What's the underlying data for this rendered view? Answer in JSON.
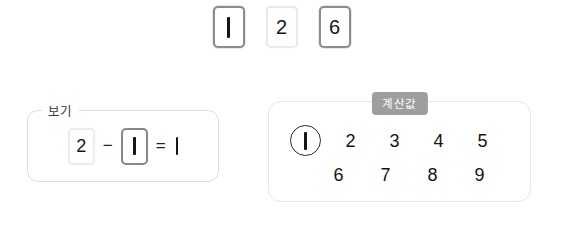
{
  "canvas": {
    "background": "#ffffff",
    "width": 563,
    "height": 233
  },
  "top_cards": {
    "name": "number-card-tray",
    "items": [
      {
        "value": "1",
        "state": "selected",
        "render": "stroke"
      },
      {
        "value": "2",
        "state": "unselected",
        "render": "glyph"
      },
      {
        "value": "6",
        "state": "selected",
        "render": "glyph"
      }
    ]
  },
  "example_box": {
    "legend": "보기",
    "equation": {
      "operand_a": "2",
      "operand_a_state": "unselected",
      "operator": "−",
      "operand_b": "1",
      "operand_b_state": "selected",
      "equals": "=",
      "result": "1"
    }
  },
  "calc_panel": {
    "badge": "계산값",
    "rows": [
      {
        "numbers": [
          {
            "value": "1",
            "circled": true,
            "render": "stroke"
          },
          {
            "value": "2",
            "circled": false,
            "render": "glyph"
          },
          {
            "value": "3",
            "circled": false,
            "render": "glyph"
          },
          {
            "value": "4",
            "circled": false,
            "render": "glyph"
          },
          {
            "value": "5",
            "circled": false,
            "render": "glyph"
          }
        ]
      },
      {
        "numbers": [
          {
            "value": "6",
            "circled": false,
            "render": "glyph"
          },
          {
            "value": "7",
            "circled": false,
            "render": "glyph"
          },
          {
            "value": "8",
            "circled": false,
            "render": "glyph"
          },
          {
            "value": "9",
            "circled": false,
            "render": "glyph"
          }
        ]
      }
    ]
  },
  "colors": {
    "selected_border": "#8c8c8c",
    "unselected_border": "#eaeaea",
    "panel_border": "#e6e6e6",
    "fieldset_border": "#dddddd",
    "badge_background": "#9e9e9e",
    "text": "#151515"
  }
}
